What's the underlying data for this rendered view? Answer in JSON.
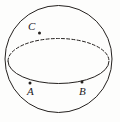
{
  "figure": {
    "kind": "geometry-diagram",
    "background_color": "#fdfdfc",
    "ink_color": "#24201e",
    "canvas": {
      "width": 120,
      "height": 122
    },
    "sphere": {
      "name": "sphere-outline",
      "shape": "circle",
      "center_x": 58.5,
      "center_y": 59,
      "radius": 53.5,
      "stroke_width": 1.0,
      "stroke_style": "solid"
    },
    "equator": {
      "name": "great-circle-ellipse",
      "shape": "ellipse",
      "center_x": 58.5,
      "center_y": 61,
      "radius_x": 50.5,
      "radius_y": 22.5,
      "front_arc_style": "solid",
      "back_arc_style": "dashed",
      "dash_pattern": "3,2.2",
      "stroke_width": 1.0
    },
    "points": [
      {
        "id": "C",
        "label": "C",
        "x": 39.5,
        "y": 33.0,
        "on": "back-arc",
        "label_x": 28,
        "label_y": 21,
        "label_position": "above-left",
        "dot_radius": 1.5
      },
      {
        "id": "A",
        "label": "A",
        "x": 30.0,
        "y": 83.0,
        "on": "front-arc",
        "label_x": 27,
        "label_y": 86,
        "label_position": "below",
        "dot_radius": 1.5
      },
      {
        "id": "B",
        "label": "B",
        "x": 82.0,
        "y": 82.0,
        "on": "front-arc",
        "label_x": 79,
        "label_y": 86,
        "label_position": "below",
        "dot_radius": 1.5
      }
    ]
  }
}
